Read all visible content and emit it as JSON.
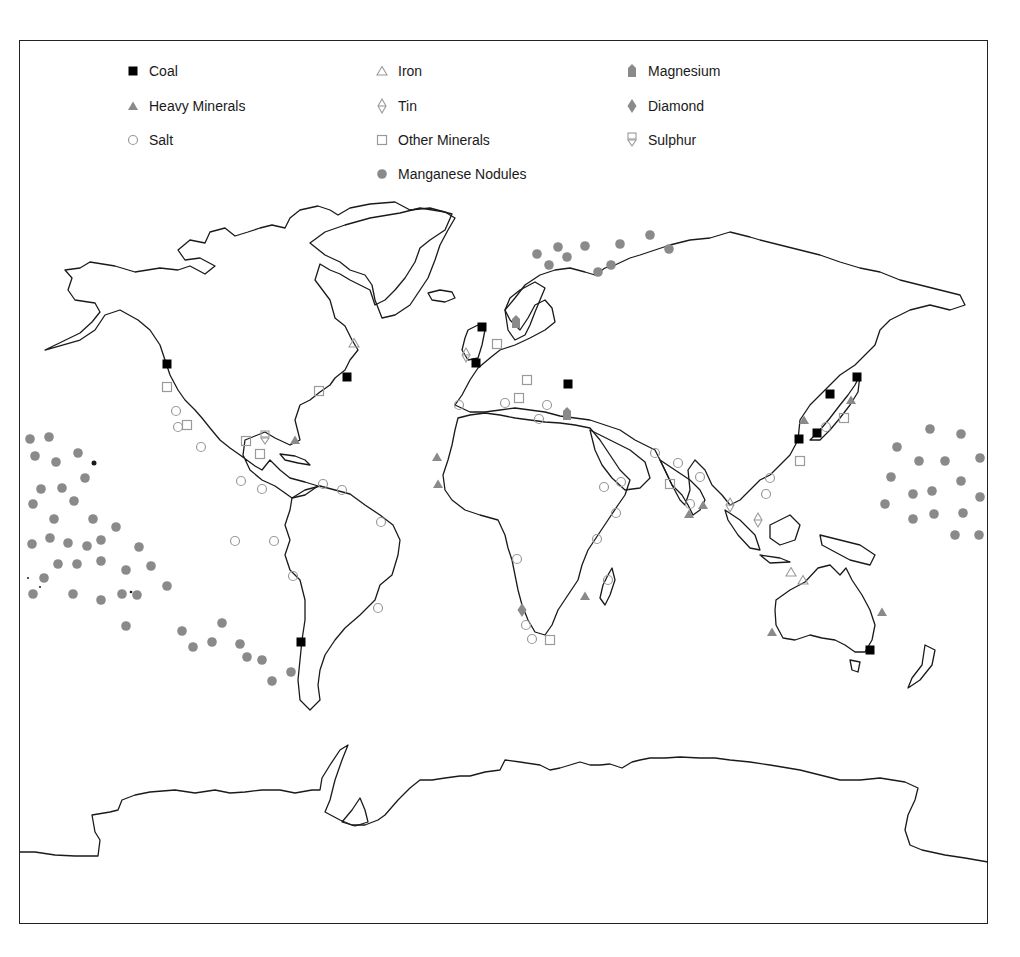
{
  "map": {
    "type": "world-map",
    "subject": "Mineral resources on and beneath the sea floor",
    "colors": {
      "coastline": "#1a1a1a",
      "coal": "#000000",
      "grey_symbol": "#8a8a8a",
      "outline_symbol": "#9a9a9a",
      "frame": "#222222"
    }
  },
  "legend": {
    "items": [
      {
        "key": "coal",
        "label": "Coal",
        "symbol": "filled-square-black",
        "x": 133,
        "y": 72
      },
      {
        "key": "heavy_minerals",
        "label": "Heavy Minerals",
        "symbol": "filled-triangle-grey",
        "x": 133,
        "y": 107
      },
      {
        "key": "salt",
        "label": "Salt",
        "symbol": "open-circle-grey",
        "x": 133,
        "y": 141
      },
      {
        "key": "iron",
        "label": "Iron",
        "symbol": "open-triangle-grey",
        "x": 382,
        "y": 72
      },
      {
        "key": "tin",
        "label": "Tin",
        "symbol": "open-triangle-over-inverted-triangle",
        "x": 382,
        "y": 107
      },
      {
        "key": "other_minerals",
        "label": "Other Minerals",
        "symbol": "open-square-grey",
        "x": 382,
        "y": 141
      },
      {
        "key": "manganese_nodules",
        "label": "Manganese Nodules",
        "symbol": "filled-circle-grey",
        "x": 382,
        "y": 175
      },
      {
        "key": "magnesium",
        "label": "Magnesium",
        "symbol": "filled-house-shape-grey",
        "x": 632,
        "y": 72
      },
      {
        "key": "diamond",
        "label": "Diamond",
        "symbol": "filled-diamond-grey",
        "x": 632,
        "y": 107
      },
      {
        "key": "sulphur",
        "label": "Sulphur",
        "symbol": "open-square-over-inverted-triangle",
        "x": 632,
        "y": 141
      }
    ]
  },
  "chart_data": {
    "type": "map",
    "title": "",
    "legend_position": "top",
    "markers": {
      "coal": [
        [
          167,
          364
        ],
        [
          482,
          327
        ],
        [
          476,
          363
        ],
        [
          347,
          377
        ],
        [
          568,
          384
        ],
        [
          301,
          642
        ],
        [
          857,
          377
        ],
        [
          830,
          394
        ],
        [
          817,
          433
        ],
        [
          799,
          439
        ],
        [
          870,
          650
        ]
      ],
      "heavy_minerals": [
        [
          295,
          440
        ],
        [
          437,
          457
        ],
        [
          438,
          484
        ],
        [
          585,
          596
        ],
        [
          689,
          514
        ],
        [
          703,
          505
        ],
        [
          804,
          420
        ],
        [
          851,
          400
        ],
        [
          882,
          612
        ],
        [
          772,
          632
        ]
      ],
      "salt": [
        [
          459,
          405
        ],
        [
          176,
          411
        ],
        [
          178,
          427
        ],
        [
          201,
          447
        ],
        [
          241,
          481
        ],
        [
          262,
          489
        ],
        [
          323,
          484
        ],
        [
          342,
          490
        ],
        [
          381,
          522
        ],
        [
          235,
          541
        ],
        [
          274,
          541
        ],
        [
          293,
          576
        ],
        [
          378,
          608
        ],
        [
          517,
          559
        ],
        [
          526,
          625
        ],
        [
          532,
          639
        ],
        [
          505,
          403
        ],
        [
          547,
          405
        ],
        [
          539,
          419
        ],
        [
          655,
          453
        ],
        [
          621,
          482
        ],
        [
          604,
          487
        ],
        [
          616,
          513
        ],
        [
          597,
          539
        ],
        [
          608,
          580
        ],
        [
          690,
          504
        ],
        [
          700,
          477
        ],
        [
          678,
          463
        ],
        [
          766,
          494
        ],
        [
          770,
          478
        ],
        [
          826,
          427
        ]
      ],
      "iron": [
        [
          354,
          343
        ],
        [
          791,
          572
        ],
        [
          803,
          580
        ]
      ],
      "tin": [
        [
          466,
          355
        ],
        [
          730,
          505
        ],
        [
          758,
          520
        ]
      ],
      "other_minerals": [
        [
          167,
          387
        ],
        [
          187,
          425
        ],
        [
          319,
          391
        ],
        [
          246,
          441
        ],
        [
          260,
          454
        ],
        [
          497,
          344
        ],
        [
          527,
          380
        ],
        [
          519,
          398
        ],
        [
          670,
          484
        ],
        [
          800,
          461
        ],
        [
          844,
          418
        ],
        [
          550,
          640
        ]
      ],
      "magnesium": [
        [
          516,
          322
        ],
        [
          567,
          414
        ]
      ],
      "diamond": [
        [
          522,
          610
        ]
      ],
      "sulphur": [
        [
          265,
          438
        ]
      ],
      "manganese_nodules": [
        [
          30,
          439
        ],
        [
          49,
          437
        ],
        [
          35,
          456
        ],
        [
          56,
          462
        ],
        [
          78,
          453
        ],
        [
          85,
          478
        ],
        [
          41,
          489
        ],
        [
          62,
          488
        ],
        [
          74,
          501
        ],
        [
          33,
          504
        ],
        [
          54,
          519
        ],
        [
          93,
          519
        ],
        [
          116,
          527
        ],
        [
          32,
          544
        ],
        [
          50,
          538
        ],
        [
          68,
          543
        ],
        [
          87,
          546
        ],
        [
          101,
          540
        ],
        [
          139,
          547
        ],
        [
          151,
          566
        ],
        [
          44,
          578
        ],
        [
          58,
          564
        ],
        [
          77,
          564
        ],
        [
          101,
          561
        ],
        [
          126,
          570
        ],
        [
          167,
          586
        ],
        [
          33,
          594
        ],
        [
          73,
          594
        ],
        [
          101,
          600
        ],
        [
          122,
          594
        ],
        [
          137,
          595
        ],
        [
          182,
          631
        ],
        [
          126,
          626
        ],
        [
          193,
          647
        ],
        [
          212,
          642
        ],
        [
          222,
          623
        ],
        [
          240,
          644
        ],
        [
          247,
          657
        ],
        [
          262,
          660
        ],
        [
          272,
          681
        ],
        [
          291,
          672
        ],
        [
          537,
          254
        ],
        [
          549,
          265
        ],
        [
          558,
          247
        ],
        [
          567,
          257
        ],
        [
          585,
          246
        ],
        [
          598,
          272
        ],
        [
          611,
          265
        ],
        [
          620,
          244
        ],
        [
          650,
          235
        ],
        [
          669,
          249
        ],
        [
          897,
          447
        ],
        [
          930,
          429
        ],
        [
          961,
          434
        ],
        [
          980,
          458
        ],
        [
          919,
          461
        ],
        [
          945,
          461
        ],
        [
          891,
          477
        ],
        [
          913,
          494
        ],
        [
          932,
          491
        ],
        [
          961,
          481
        ],
        [
          980,
          497
        ],
        [
          885,
          504
        ],
        [
          913,
          519
        ],
        [
          934,
          514
        ],
        [
          963,
          513
        ],
        [
          955,
          535
        ],
        [
          979,
          535
        ]
      ]
    }
  }
}
